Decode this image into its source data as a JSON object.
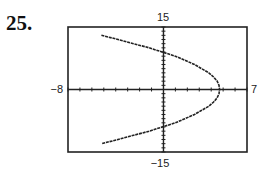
{
  "problem": {
    "number": "25."
  },
  "chart_data": {
    "type": "line",
    "title": "",
    "xlabel": "",
    "ylabel": "",
    "xlim": [
      -8,
      7
    ],
    "ylim": [
      -15,
      15
    ],
    "window_labels": {
      "xmin": "−8",
      "xmax": "7",
      "ymin": "−15",
      "ymax": "15"
    },
    "grid": false,
    "tick_marks": {
      "x_step": 1,
      "y_step": 1
    },
    "series": [
      {
        "name": "sideways parabola (opens left)",
        "description": "x = 4.7 - y^2/17",
        "points": [
          {
            "x": -5.2,
            "y": 13
          },
          {
            "x": -3.8,
            "y": 12
          },
          {
            "x": -2.5,
            "y": 11
          },
          {
            "x": -1.2,
            "y": 10
          },
          {
            "x": 0.0,
            "y": 8.9
          },
          {
            "x": 1.0,
            "y": 8
          },
          {
            "x": 1.8,
            "y": 7
          },
          {
            "x": 2.6,
            "y": 6
          },
          {
            "x": 3.2,
            "y": 5
          },
          {
            "x": 3.8,
            "y": 4
          },
          {
            "x": 4.2,
            "y": 3
          },
          {
            "x": 4.5,
            "y": 2
          },
          {
            "x": 4.65,
            "y": 1
          },
          {
            "x": 4.7,
            "y": 0
          },
          {
            "x": 4.65,
            "y": -1
          },
          {
            "x": 4.5,
            "y": -2
          },
          {
            "x": 4.2,
            "y": -3
          },
          {
            "x": 3.8,
            "y": -4
          },
          {
            "x": 3.2,
            "y": -5
          },
          {
            "x": 2.6,
            "y": -6
          },
          {
            "x": 1.8,
            "y": -7
          },
          {
            "x": 1.0,
            "y": -8
          },
          {
            "x": 0.0,
            "y": -8.9
          },
          {
            "x": -1.2,
            "y": -10
          },
          {
            "x": -2.5,
            "y": -11
          },
          {
            "x": -3.8,
            "y": -12
          },
          {
            "x": -5.2,
            "y": -13
          }
        ]
      }
    ],
    "annotations": {
      "vertex_approx": {
        "x": 4.7,
        "y": 0
      },
      "y_intercepts_approx": [
        8.9,
        -8.9
      ]
    },
    "legend": null
  }
}
